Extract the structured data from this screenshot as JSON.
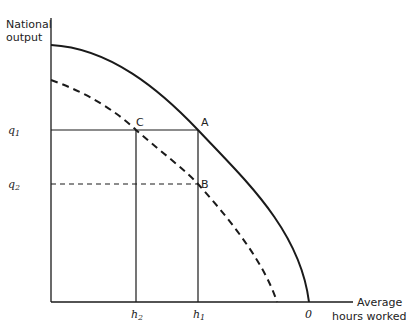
{
  "diagram": {
    "y_axis_label_line1": "National",
    "y_axis_label_line2": "output",
    "x_axis_label_line1": "Average",
    "x_axis_label_line2": "hours worked",
    "y_ticks": {
      "q1": "q",
      "q1_sub": "1",
      "q2": "q",
      "q2_sub": "2"
    },
    "x_ticks": {
      "h2": "h",
      "h2_sub": "2",
      "h1": "h",
      "h1_sub": "1",
      "zero": "0"
    },
    "points": {
      "A": "A",
      "B": "B",
      "C": "C"
    },
    "curves": [
      {
        "name": "outer-frontier",
        "style": "solid"
      },
      {
        "name": "inner-frontier",
        "style": "dashed"
      }
    ],
    "line_color": "#1a1a1a"
  }
}
